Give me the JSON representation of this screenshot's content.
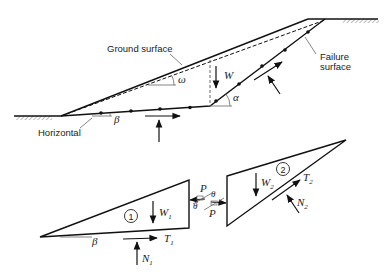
{
  "figure": {
    "upper": {
      "labels": {
        "ground_surface": "Ground surface",
        "failure_surface_line1": "Failure",
        "failure_surface_line2": "surface",
        "horizontal": "Horizontal"
      },
      "symbols": {
        "weight": "W",
        "slope_angle": "ω",
        "inclined_angle": "α",
        "base_angle": "β"
      }
    },
    "lower": {
      "wedge1": {
        "number": "1",
        "weight": "W",
        "weight_sub": "1",
        "shear": "T",
        "shear_sub": "1",
        "normal": "N",
        "normal_sub": "1",
        "base_angle": "β"
      },
      "wedge2": {
        "number": "2",
        "weight": "W",
        "weight_sub": "2",
        "shear": "T",
        "shear_sub": "2",
        "normal": "N",
        "normal_sub": "2"
      },
      "interaction": {
        "force_top": "P",
        "force_bottom": "P",
        "angle_left": "θ",
        "angle_right": "θ"
      }
    }
  }
}
